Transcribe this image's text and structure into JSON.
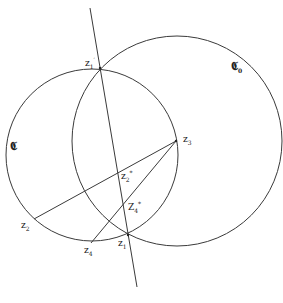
{
  "diagram": {
    "stroke_color": "#3a3a3a",
    "background": "#ffffff",
    "circles": [
      {
        "id": "C",
        "label": "𝕮",
        "sub": "",
        "cx": 92,
        "cy": 155,
        "r": 86
      },
      {
        "id": "C0",
        "label": "𝕮",
        "sub": "0",
        "cx": 177,
        "cy": 141,
        "r": 105
      }
    ],
    "line": {
      "x1": 90,
      "y1": 8,
      "x2": 137,
      "y2": 287
    },
    "segments": [
      {
        "from": "z3",
        "to": "z2"
      },
      {
        "from": "z3",
        "to": "z4"
      }
    ],
    "points": {
      "z1_prime": {
        "base": "z",
        "sub": "1",
        "sup": "′",
        "x": 100,
        "y": 68
      },
      "z1": {
        "base": "z",
        "sub": "1",
        "sup": "",
        "x": 128,
        "y": 235
      },
      "z2": {
        "base": "z",
        "sub": "2",
        "sup": "",
        "x": 34,
        "y": 219
      },
      "z3": {
        "base": "z",
        "sub": "3",
        "sup": "",
        "x": 176,
        "y": 141
      },
      "z4": {
        "base": "z",
        "sub": "4",
        "sup": "",
        "x": 91,
        "y": 243
      },
      "z2_star": {
        "base": "z",
        "sub": "2",
        "sup": "*",
        "x": 119,
        "y": 173
      },
      "z4_star": {
        "base": "z",
        "sub": "4",
        "sup": "*",
        "x": 126,
        "y": 207
      }
    },
    "labels": {
      "z1_prime": {
        "base": "z",
        "sub": "1",
        "sup": "′"
      },
      "z1": {
        "base": "z",
        "sub": "1"
      },
      "z2": {
        "base": "z",
        "sub": "2"
      },
      "z3": {
        "base": "z",
        "sub": "3"
      },
      "z4": {
        "base": "z",
        "sub": "4"
      },
      "z2_star": {
        "base": "z",
        "sub": "2",
        "sup": "*"
      },
      "z4_star": {
        "base": "Z",
        "sub": "4",
        "sup": "*"
      },
      "C": {
        "base": "𝕮",
        "sub": ""
      },
      "C0": {
        "base": "𝕮",
        "sub": "0"
      }
    }
  }
}
